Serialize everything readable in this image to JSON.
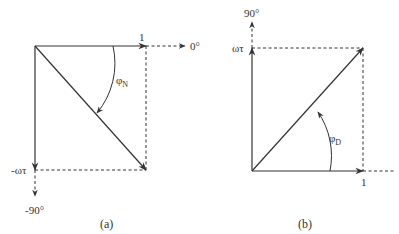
{
  "diagram_a": {
    "caption": "(a)",
    "labels": {
      "one": "1",
      "zero_deg": "0°",
      "neg_omega_tau": "-ωτ",
      "neg_90_deg": "-90°",
      "phi": "φ",
      "phi_sub": "N"
    }
  },
  "diagram_b": {
    "caption": "(b)",
    "labels": {
      "one": "1",
      "ninety_deg": "90°",
      "omega_tau": "ωτ",
      "phi": "φ",
      "phi_sub": "D"
    }
  },
  "colors": {
    "line": "#333333",
    "background": "#ffffff"
  }
}
